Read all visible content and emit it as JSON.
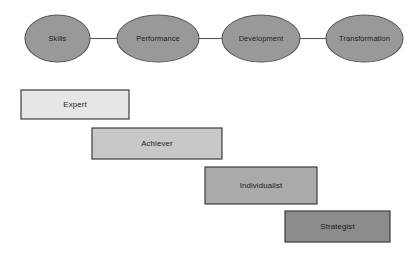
{
  "diagram": {
    "background_color": "#ffffff",
    "flow": {
      "node_fill": "#999999",
      "node_stroke": "#575757",
      "connector_color": "#575757",
      "label_color": "#1a1a1a",
      "nodes": [
        {
          "id": "skills",
          "label": "Skills",
          "cx": 57.5,
          "cy": 38.5,
          "rx": 32.5,
          "ry": 23.5
        },
        {
          "id": "performance",
          "label": "Performance",
          "cx": 158,
          "cy": 38.5,
          "rx": 41,
          "ry": 23.5
        },
        {
          "id": "development",
          "label": "Development",
          "cx": 261,
          "cy": 38.5,
          "rx": 39,
          "ry": 23.5
        },
        {
          "id": "transformation",
          "label": "Transformation",
          "cx": 364.5,
          "cy": 38.5,
          "rx": 38.5,
          "ry": 23.5
        }
      ],
      "connectors": [
        {
          "from": "skills",
          "to": "performance",
          "x1": 90,
          "x2": 117,
          "y": 38.5
        },
        {
          "from": "performance",
          "to": "development",
          "x1": 199,
          "x2": 222,
          "y": 38.5
        },
        {
          "from": "development",
          "to": "transformation",
          "x1": 300,
          "x2": 326,
          "y": 38.5
        }
      ]
    },
    "stages": {
      "stroke_color": "#3d3d3d",
      "label_color": "#1a1a1a",
      "items": [
        {
          "id": "expert",
          "label": "Expert",
          "x": 21,
          "y": 90,
          "width": 108,
          "height": 29,
          "fill": "#e6e6e6"
        },
        {
          "id": "achiever",
          "label": "Achiever",
          "x": 92,
          "y": 128,
          "width": 130,
          "height": 31,
          "fill": "#c8c8c8"
        },
        {
          "id": "individualist",
          "label": "Individualist",
          "x": 205,
          "y": 167,
          "width": 112,
          "height": 37,
          "fill": "#aaaaaa"
        },
        {
          "id": "strategist",
          "label": "Strategist",
          "x": 285,
          "y": 211,
          "width": 105,
          "height": 31,
          "fill": "#8c8c8c"
        }
      ]
    }
  }
}
